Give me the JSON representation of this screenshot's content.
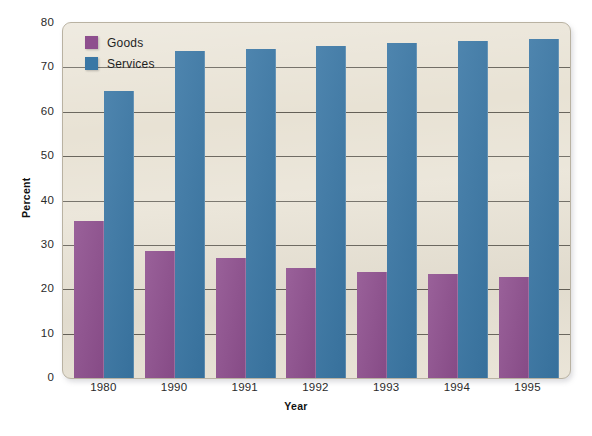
{
  "chart_data": {
    "type": "bar",
    "title": "",
    "xlabel": "Year",
    "ylabel": "Percent",
    "categories": [
      "1980",
      "1990",
      "1991",
      "1992",
      "1993",
      "1994",
      "1995"
    ],
    "series": [
      {
        "name": "Goods",
        "color": "#8e4f8e",
        "values": [
          35.4,
          28.7,
          27.0,
          24.8,
          24.0,
          23.5,
          22.8
        ]
      },
      {
        "name": "Services",
        "color": "#3a77a5",
        "values": [
          64.7,
          73.8,
          74.2,
          74.8,
          75.5,
          75.9,
          76.4
        ]
      }
    ],
    "ylim": [
      0,
      80
    ],
    "yticks": [
      "0",
      "10",
      "20",
      "30",
      "40",
      "50",
      "60",
      "70",
      "80"
    ],
    "grid": true,
    "legend_position": "top-left",
    "plot_background_color": "#e8e2d4"
  }
}
